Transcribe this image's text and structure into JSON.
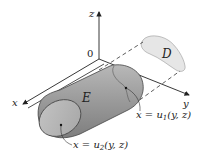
{
  "figure": {
    "axes": {
      "x_label": "x",
      "y_label": "y",
      "z_label": "z",
      "origin_label": "0"
    },
    "regions": {
      "solid_label": "E",
      "projection_label": "D"
    },
    "surfaces": {
      "back_surface": "x = u₁(y, z)",
      "front_surface": "x = u₂(y, z)",
      "back_surface_parts": {
        "lhs": "x = u",
        "sub": "1",
        "rhs": "(y, z)"
      },
      "front_surface_parts": {
        "lhs": "x = u",
        "sub": "2",
        "rhs": "(y, z)"
      }
    },
    "colors": {
      "solid_fill": "#9a9a9a",
      "solid_end_fill": "#b4b4b4",
      "back_cap_fill": "#8c8c8c",
      "projection_fill": "#e6e6e6",
      "axis_stroke": "#222222",
      "dashed_stroke": "#333333",
      "background": "#ffffff"
    }
  }
}
